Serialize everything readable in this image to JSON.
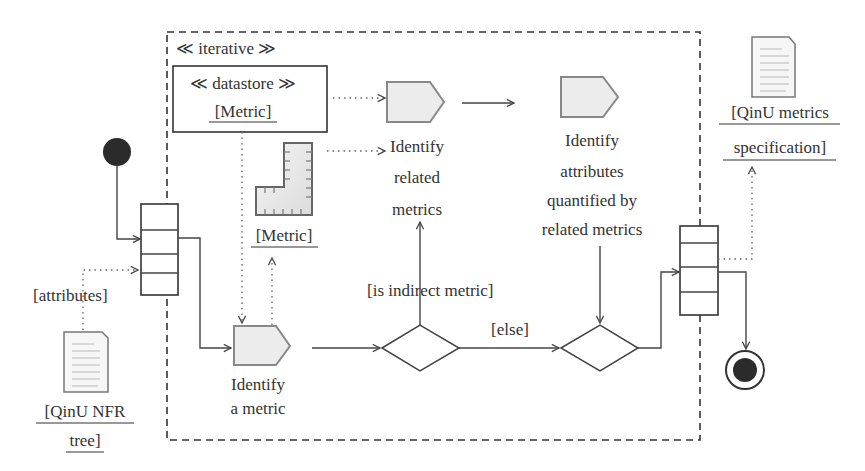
{
  "diagram": {
    "type": "UML activity diagram",
    "region": {
      "stereotype": "≪ iterative ≫"
    },
    "datastore": {
      "stereotype": "≪ datastore ≫",
      "name": "[Metric]"
    },
    "ruler_object": {
      "name": "[Metric]"
    },
    "input_document": {
      "line1": "[QinU NFR",
      "line2": "tree]"
    },
    "input_pin_label": "[attributes]",
    "output_document": {
      "line1": "[QinU metrics",
      "line2": "specification]"
    },
    "actions": [
      {
        "id": "identify-a-metric",
        "lines": [
          "Identify",
          "a metric"
        ]
      },
      {
        "id": "identify-related-metrics",
        "lines": [
          "Identify",
          "related",
          "metrics"
        ]
      },
      {
        "id": "identify-attributes",
        "lines": [
          "Identify",
          "attributes",
          "quantified by",
          "related metrics"
        ]
      }
    ],
    "guards": {
      "indirect": "[is indirect metric]",
      "else": "[else]"
    },
    "colors": {
      "line": "#444444",
      "action_fill": "#ececec",
      "action_border": "#888888",
      "node_fill": "#2b2b2b",
      "text": "#333333"
    }
  }
}
